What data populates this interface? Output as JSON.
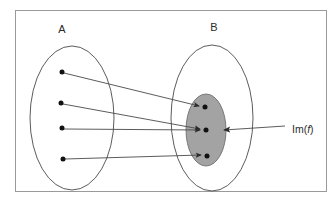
{
  "figure": {
    "kind": "set-mapping-diagram",
    "background_color": "#ffffff",
    "frame": {
      "name": "figure-border",
      "x": 15,
      "y": 10,
      "width": 312,
      "height": 182,
      "stroke": "#9a9a9a",
      "stroke_width": 1,
      "fill": "#ffffff"
    },
    "labels": {
      "domain_label": "A",
      "codomain_label": "B",
      "image_label_prefix": "Im(",
      "image_label_italic": "f",
      "image_label_suffix": ")",
      "image_label_full": "Im(f)"
    },
    "colors": {
      "outline": "#4a4a4a",
      "image_fill": "#a3a3a3",
      "image_stroke": "#6e6e6e",
      "dot": "#111111",
      "arrow": "#4a4a4a",
      "text": "#2b2b2b"
    },
    "domain_ellipse": {
      "name": "set-a-ellipse",
      "cx": 72,
      "cy": 118,
      "rx": 42,
      "ry": 72,
      "fill": "#ffffff"
    },
    "codomain_ellipse": {
      "name": "set-b-ellipse",
      "cx": 212,
      "cy": 118,
      "rx": 41,
      "ry": 73,
      "fill": "#ffffff"
    },
    "image_ellipse": {
      "name": "image-of-f-ellipse",
      "cx": 206,
      "cy": 130,
      "rx": 20,
      "ry": 36
    },
    "label_positions": {
      "a_x": 62,
      "a_y": 30,
      "b_x": 214,
      "b_y": 28,
      "im_x": 292,
      "im_y": 130
    },
    "domain_points": [
      {
        "name": "domain-point-1",
        "x": 62,
        "y": 72,
        "r": 2.5
      },
      {
        "name": "domain-point-2",
        "x": 61,
        "y": 103,
        "r": 2.5
      },
      {
        "name": "domain-point-3",
        "x": 62,
        "y": 128,
        "r": 2.5
      },
      {
        "name": "domain-point-4",
        "x": 63,
        "y": 159,
        "r": 2.5
      }
    ],
    "image_points": [
      {
        "name": "image-point-1",
        "x": 205,
        "y": 107,
        "r": 2.5
      },
      {
        "name": "image-point-2",
        "x": 206,
        "y": 130,
        "r": 2.5
      },
      {
        "name": "image-point-3",
        "x": 207,
        "y": 156,
        "r": 2.5
      }
    ],
    "mapping_arrows": [
      {
        "name": "arrow-a1-to-b1",
        "x1": 64,
        "y1": 73,
        "x2": 201,
        "y2": 106
      },
      {
        "name": "arrow-a2-to-b2",
        "x1": 63,
        "y1": 104,
        "x2": 202,
        "y2": 129
      },
      {
        "name": "arrow-a3-to-b2",
        "x1": 64,
        "y1": 129,
        "x2": 202,
        "y2": 130
      },
      {
        "name": "arrow-a4-to-b3",
        "x1": 65,
        "y1": 159,
        "x2": 203,
        "y2": 155
      }
    ],
    "callout_arrow": {
      "name": "im-callout-arrow",
      "x1": 285,
      "y1": 126,
      "x2": 222,
      "y2": 130
    }
  }
}
